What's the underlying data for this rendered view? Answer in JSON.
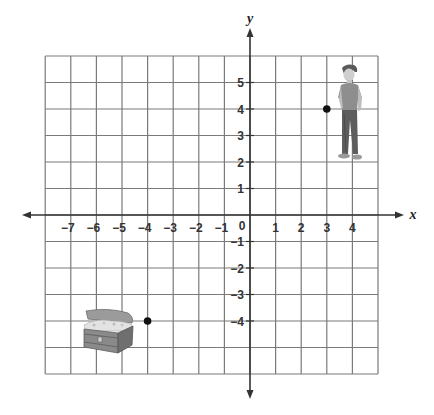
{
  "diagram": {
    "type": "coordinate-plane",
    "axes": {
      "x_label": "x",
      "y_label": "y",
      "x_tick_labels": [
        {
          "value": -7,
          "label": "−7"
        },
        {
          "value": -6,
          "label": "−6"
        },
        {
          "value": -5,
          "label": "−5"
        },
        {
          "value": -4,
          "label": "−4"
        },
        {
          "value": -3,
          "label": "−3"
        },
        {
          "value": -2,
          "label": "−2"
        },
        {
          "value": -1,
          "label": "−1"
        },
        {
          "value": 1,
          "label": "1"
        },
        {
          "value": 2,
          "label": "2"
        },
        {
          "value": 3,
          "label": "3"
        },
        {
          "value": 4,
          "label": "4"
        }
      ],
      "origin_label": "0",
      "y_tick_labels": [
        {
          "value": 5,
          "label": "5"
        },
        {
          "value": 4,
          "label": "4"
        },
        {
          "value": 3,
          "label": "3"
        },
        {
          "value": 2,
          "label": "2"
        },
        {
          "value": 1,
          "label": "1"
        },
        {
          "value": -1,
          "label": "−1"
        },
        {
          "value": -2,
          "label": "−2"
        },
        {
          "value": -3,
          "label": "−3"
        },
        {
          "value": -4,
          "label": "−4"
        }
      ],
      "grid_x_range": [
        -8,
        5
      ],
      "grid_y_range": [
        -6,
        6
      ]
    },
    "points": [
      {
        "name": "boy",
        "x": 3,
        "y": 4,
        "image": "boy-figure"
      },
      {
        "name": "treasure-chest",
        "x": -4,
        "y": -4,
        "image": "treasure-chest"
      }
    ],
    "colors": {
      "grid": "#7a7a7a",
      "axis": "#333333",
      "point": "#111111"
    }
  }
}
